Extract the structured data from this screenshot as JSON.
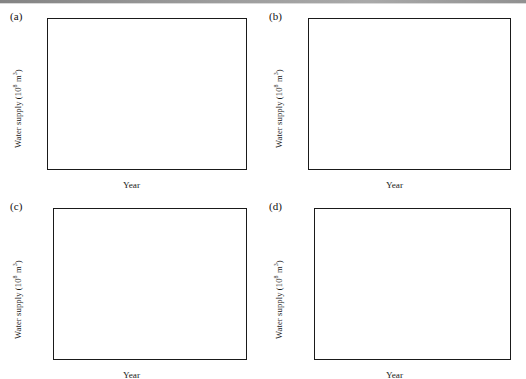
{
  "figure": {
    "axis_titles": {
      "x": "Year",
      "y_prefix": "Water supply (10",
      "y_exp": "8",
      "y_suffix": " m",
      "y_suffix_exp": "3",
      "y_close": ")"
    },
    "y_axis_label_full": "Water supply (10^8 m^3)",
    "colors": {
      "sw": "#3b3671",
      "gw": "#4f5fae",
      "other": "#b9b7dd",
      "axis": "#1a1a1a",
      "background": "#ffffff"
    }
  },
  "panels": [
    {
      "id": "a",
      "label": "(a)",
      "region": "Beijing"
    },
    {
      "id": "b",
      "label": "(b)",
      "region": "Tianjin"
    },
    {
      "id": "c",
      "label": "(c)",
      "region": "Hebei"
    },
    {
      "id": "d",
      "label": "(d)",
      "region": "B+T+H"
    }
  ],
  "legends": {
    "a": [
      "Beijing-SW",
      "Beijing-GW",
      "Beijing-Other"
    ],
    "b": [
      "Tianjin-SW",
      "Tianjing-GW",
      "Tianjin-Other"
    ],
    "c": [
      "Hebei-SW",
      "Hebei-GW",
      "Hebei-Other"
    ],
    "d": [
      "B+T+H-SW",
      "B+T+H-GW",
      "B+T+H-Other"
    ]
  },
  "ticks": {
    "x_labels": [
      "2000",
      "2005",
      "2010",
      "2015",
      "2020"
    ],
    "x_values": [
      2000,
      2005,
      2010,
      2015,
      2020
    ],
    "y_labels_50": [
      "0",
      "10",
      "20",
      "30",
      "40",
      "50"
    ],
    "y_values_50": [
      0,
      10,
      20,
      30,
      40,
      50
    ],
    "y_labels_350": [
      "0",
      "50",
      "100",
      "150",
      "200",
      "250",
      "300",
      "350"
    ],
    "y_values_350": [
      0,
      50,
      100,
      150,
      200,
      250,
      300,
      350
    ]
  },
  "chart_data": [
    {
      "panel": "a",
      "type": "area",
      "title": "(a) Beijing",
      "xlabel": "Year",
      "ylabel": "Water supply (10^8 m^3)",
      "xlim": [
        2000,
        2020
      ],
      "ylim": [
        0,
        50
      ],
      "grid": false,
      "legend_position": "top-left",
      "stacked": true,
      "x": [
        2000,
        2001,
        2002,
        2003,
        2004,
        2005,
        2006,
        2007,
        2008,
        2009,
        2010,
        2011,
        2012,
        2013,
        2014,
        2015,
        2016,
        2017,
        2018,
        2019,
        2020
      ],
      "series": [
        {
          "name": "Beijing-SW",
          "color": "#3b3671",
          "values": [
            13.0,
            11.0,
            9.0,
            7.3,
            6.6,
            6.8,
            6.5,
            6.1,
            5.9,
            5.5,
            5.2,
            5.0,
            5.1,
            5.3,
            6.5,
            5.2,
            4.2,
            3.8,
            4.2,
            7.3,
            9.0
          ]
        },
        {
          "name": "Beijing-GW",
          "color": "#4f5fae",
          "values": [
            27.0,
            24.0,
            23.0,
            23.0,
            22.5,
            22.0,
            21.0,
            21.1,
            20.4,
            21.0,
            21.5,
            21.2,
            21.0,
            20.2,
            20.5,
            20.0,
            19.0,
            16.4,
            15.8,
            14.0,
            13.5
          ]
        },
        {
          "name": "Beijing-Other",
          "color": "#b9b7dd",
          "values": [
            0.0,
            0.2,
            1.5,
            4.0,
            5.9,
            6.2,
            7.5,
            8.1,
            9.5,
            9.6,
            8.9,
            9.4,
            9.8,
            10.8,
            9.2,
            10.3,
            12.5,
            16.0,
            19.3,
            20.1,
            18.5
          ]
        }
      ],
      "series_totals": [
        40.0,
        35.2,
        33.5,
        34.3,
        35.0,
        35.0,
        35.0,
        35.3,
        35.8,
        36.1,
        35.6,
        35.6,
        35.9,
        36.3,
        36.2,
        35.5,
        35.7,
        36.2,
        39.3,
        41.4,
        41.0
      ]
    },
    {
      "panel": "b",
      "type": "area",
      "title": "(b) Tianjin",
      "xlabel": "Year",
      "ylabel": "Water supply (10^8 m^3)",
      "xlim": [
        2000,
        2020
      ],
      "ylim": [
        0,
        50
      ],
      "grid": false,
      "legend_position": "top-left",
      "stacked": true,
      "x": [
        2000,
        2001,
        2002,
        2003,
        2004,
        2005,
        2006,
        2007,
        2008,
        2009,
        2010,
        2011,
        2012,
        2013,
        2014,
        2015,
        2016,
        2017,
        2018,
        2019,
        2020
      ],
      "series": [
        {
          "name": "Tianjin-SW",
          "color": "#3b3671",
          "values": [
            14.2,
            12.0,
            12.2,
            13.6,
            14.6,
            15.2,
            16.3,
            16.3,
            16.0,
            17.0,
            16.7,
            16.6,
            16.3,
            17.0,
            18.0,
            18.9,
            19.8,
            20.5,
            20.0,
            19.6,
            19.7
          ]
        },
        {
          "name": "Tianjing-GW",
          "color": "#4f5fae",
          "values": [
            8.0,
            7.9,
            7.2,
            7.2,
            7.3,
            7.4,
            7.1,
            7.2,
            6.9,
            6.0,
            6.1,
            5.9,
            5.5,
            4.6,
            4.6,
            4.2,
            4.0,
            4.3,
            3.6,
            3.3,
            3.1
          ]
        },
        {
          "name": "Tianjin-Other",
          "color": "#b9b7dd",
          "values": [
            0.0,
            0.0,
            0.0,
            0.0,
            0.1,
            0.1,
            0.1,
            0.3,
            0.6,
            0.5,
            0.6,
            0.6,
            0.9,
            1.9,
            2.6,
            3.0,
            3.8,
            4.3,
            5.0,
            5.6,
            6.0
          ]
        }
      ],
      "series_totals": [
        22.2,
        19.9,
        19.4,
        20.8,
        22.0,
        22.7,
        23.5,
        23.8,
        23.5,
        23.5,
        23.4,
        23.1,
        22.7,
        23.5,
        25.2,
        26.1,
        27.6,
        29.1,
        28.6,
        28.5,
        28.8
      ]
    },
    {
      "panel": "c",
      "type": "area",
      "title": "(c) Hebei",
      "xlabel": "Year",
      "ylabel": "Water supply (10^8 m^3)",
      "xlim": [
        2000,
        2020
      ],
      "ylim": [
        0,
        350
      ],
      "grid": false,
      "legend_position": "top-left",
      "stacked": true,
      "x": [
        2000,
        2001,
        2002,
        2003,
        2004,
        2005,
        2006,
        2007,
        2008,
        2009,
        2010,
        2011,
        2012,
        2013,
        2014,
        2015,
        2016,
        2017,
        2018,
        2019,
        2020
      ],
      "series": [
        {
          "name": "Hebei-SW",
          "color": "#3b3671",
          "values": [
            42.0,
            44.0,
            40.0,
            37.0,
            37.5,
            38.0,
            40.0,
            40.5,
            41.0,
            43.0,
            45.0,
            46.0,
            47.0,
            48.0,
            50.0,
            52.0,
            56.0,
            62.0,
            70.0,
            80.0,
            89.0
          ]
        },
        {
          "name": "Hebei-GW",
          "color": "#4f5fae",
          "values": [
            169.0,
            167.0,
            160.0,
            157.0,
            161.0,
            163.0,
            163.0,
            157.0,
            155.0,
            152.0,
            150.0,
            148.0,
            146.0,
            143.0,
            138.0,
            133.0,
            126.0,
            119.0,
            112.0,
            101.0,
            88.0
          ]
        },
        {
          "name": "Hebei-Other",
          "color": "#b9b7dd",
          "values": [
            0.0,
            0.0,
            0.0,
            0.0,
            0.0,
            0.0,
            0.0,
            0.0,
            0.0,
            0.5,
            0.8,
            1.0,
            1.5,
            2.0,
            2.5,
            3.0,
            4.0,
            5.0,
            6.5,
            8.0,
            10.0
          ]
        }
      ],
      "series_totals": [
        211.0,
        211.0,
        200.0,
        194.0,
        198.5,
        201.0,
        203.0,
        197.5,
        196.0,
        195.5,
        195.8,
        195.0,
        194.5,
        193.0,
        190.5,
        188.0,
        186.0,
        186.0,
        188.5,
        189.0,
        187.0
      ]
    },
    {
      "panel": "d",
      "type": "area",
      "title": "(d) B+T+H",
      "xlabel": "Year",
      "ylabel": "Water supply (10^8 m^3)",
      "xlim": [
        2000,
        2020
      ],
      "ylim": [
        0,
        350
      ],
      "grid": false,
      "legend_position": "top-left",
      "stacked": true,
      "x": [
        2000,
        2001,
        2002,
        2003,
        2004,
        2005,
        2006,
        2007,
        2008,
        2009,
        2010,
        2011,
        2012,
        2013,
        2014,
        2015,
        2016,
        2017,
        2018,
        2019,
        2020
      ],
      "series": [
        {
          "name": "B+T+H-SW",
          "color": "#3b3671",
          "values": [
            69.2,
            67.0,
            61.2,
            57.9,
            58.7,
            60.0,
            62.8,
            62.9,
            62.9,
            65.5,
            66.9,
            67.6,
            68.4,
            70.3,
            74.5,
            76.1,
            80.0,
            86.3,
            94.2,
            106.9,
            117.7
          ]
        },
        {
          "name": "B+T+H-GW",
          "color": "#4f5fae",
          "values": [
            204.0,
            198.9,
            190.2,
            187.2,
            190.8,
            192.4,
            191.1,
            185.3,
            182.3,
            179.0,
            177.6,
            175.1,
            172.5,
            167.8,
            163.1,
            157.2,
            149.0,
            139.7,
            131.4,
            118.3,
            104.6
          ]
        },
        {
          "name": "B+T+H-Other",
          "color": "#b9b7dd",
          "values": [
            0.0,
            0.2,
            1.5,
            4.0,
            6.0,
            6.3,
            7.6,
            8.4,
            10.1,
            10.6,
            10.3,
            11.0,
            12.2,
            14.7,
            14.3,
            16.3,
            20.3,
            25.3,
            30.8,
            33.7,
            34.5
          ]
        }
      ],
      "series_totals": [
        273.2,
        266.1,
        252.9,
        249.1,
        255.5,
        258.7,
        261.5,
        256.6,
        255.3,
        255.1,
        254.8,
        253.7,
        253.1,
        252.8,
        251.9,
        249.6,
        249.3,
        251.3,
        256.4,
        258.9,
        256.8
      ]
    }
  ]
}
